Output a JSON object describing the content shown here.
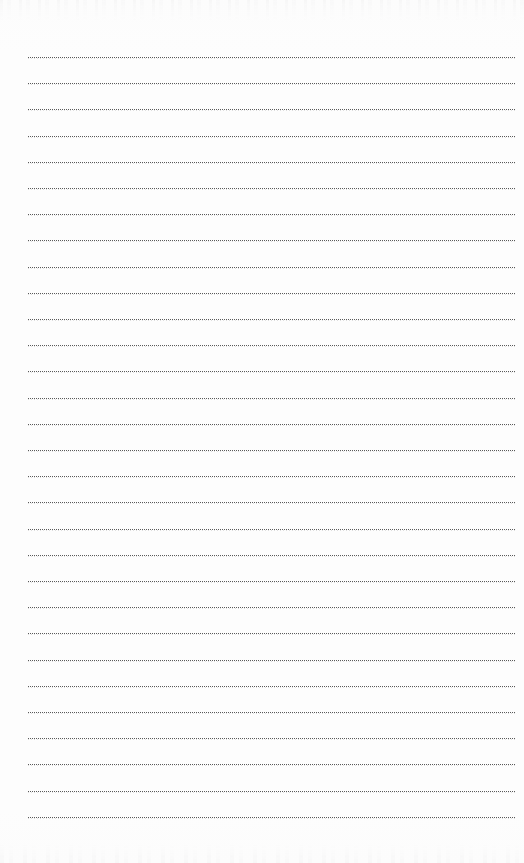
{
  "document": {
    "kind": "blank-lined-notebook-page",
    "background_color": "#fdfdfd",
    "width": 524,
    "height": 863,
    "body_text": "",
    "has_written_content": false
  },
  "rules": {
    "count": 30,
    "first_line_y": 57,
    "line_spacing": 26.2,
    "left_margin_x": 28,
    "right_edge_x": 516,
    "dot_color": "#5a5a5a",
    "dot_size_px": 1,
    "dot_gap_px": 1,
    "style": "dotted"
  },
  "artifacts": {
    "top_edge": {
      "label": "cropped-content-bleed-top",
      "y": 0,
      "height": 22,
      "color": "#8c8c91",
      "opacity": 0.55
    },
    "bottom_edge": {
      "label": "cropped-content-bleed-bottom",
      "y": 843,
      "height": 20,
      "color": "#919196",
      "opacity": 0.55
    }
  }
}
